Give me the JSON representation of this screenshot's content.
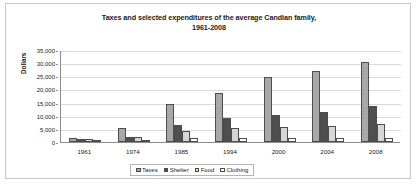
{
  "chart_data": {
    "type": "bar",
    "title": "Taxes and selected expenditures of the average Candian family, 1961-2008",
    "title_line1": "Taxes and selected expenditures of the average Candian family,",
    "title_line2": "1961-2008",
    "xlabel": "",
    "ylabel": "Dollars",
    "ylim": [
      0,
      35000
    ],
    "grid": true,
    "legend_position": "bottom",
    "categories": [
      "1961",
      "1974",
      "1985",
      "1994",
      "2000",
      "2004",
      "2008"
    ],
    "ytick_labels": [
      "0",
      "5,000",
      "10,000",
      "15,000",
      "20,000",
      "25,000",
      "30,000",
      "35,000"
    ],
    "ytick_values": [
      0,
      5000,
      10000,
      15000,
      20000,
      25000,
      30000,
      35000
    ],
    "series": [
      {
        "name": "Taxes",
        "color": "#a8a8a8",
        "values": [
          1675,
          5180,
          14550,
          18550,
          24850,
          26950,
          30450
        ]
      },
      {
        "name": "Shelter",
        "color": "#4f4f4f",
        "values": [
          1100,
          2000,
          6550,
          9200,
          10150,
          11500,
          13800
        ]
      },
      {
        "name": "Food",
        "color": "#d6d6d6",
        "values": [
          1250,
          2050,
          4350,
          5500,
          5550,
          6200,
          6750
        ]
      },
      {
        "name": "Clothing",
        "color": "#ffffff",
        "values": [
          500,
          700,
          1600,
          1500,
          1400,
          1350,
          1650
        ]
      }
    ]
  }
}
